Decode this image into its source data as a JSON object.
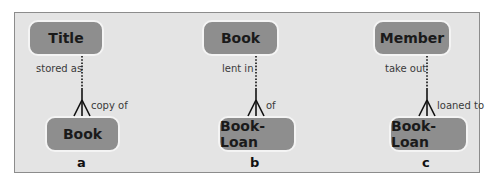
{
  "diagram": {
    "type": "entity-relationship",
    "panels": [
      {
        "id": "a",
        "label": "a",
        "top_entity": "Title",
        "bottom_entity": "Book",
        "top_role": "stored as",
        "bottom_role": "copy of",
        "top_optional": true,
        "bottom_many": true
      },
      {
        "id": "b",
        "label": "b",
        "top_entity": "Book",
        "bottom_entity": "Book-Loan",
        "top_role": "lent in",
        "bottom_role": "of",
        "top_optional": true,
        "bottom_many": true
      },
      {
        "id": "c",
        "label": "c",
        "top_entity": "Member",
        "bottom_entity": "Book-Loan",
        "top_role": "take out",
        "bottom_role": "loaned to",
        "top_optional": true,
        "bottom_many": true
      }
    ],
    "colors": {
      "frame_bg": "#e4e4e4",
      "frame_border": "#8c8c8c",
      "entity_fill": "#8e8e8e",
      "entity_border": "#f4f4f4",
      "line": "#111111"
    }
  }
}
